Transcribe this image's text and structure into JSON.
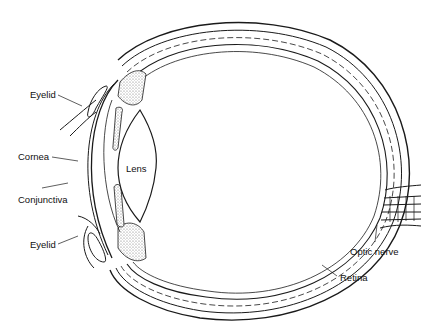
{
  "diagram": {
    "type": "anatomical-cross-section",
    "labels": {
      "eyelid_upper": "Eyelid",
      "cornea": "Cornea",
      "conjunctiva": "Conjunctiva",
      "eyelid_lower": "Eyelid",
      "lens": "Lens",
      "optic_nerve": "Optic nerve",
      "retina": "Retina"
    },
    "colors": {
      "line": "#1a1a1a",
      "background": "#ffffff",
      "stipple": "#bdbdbd"
    }
  }
}
